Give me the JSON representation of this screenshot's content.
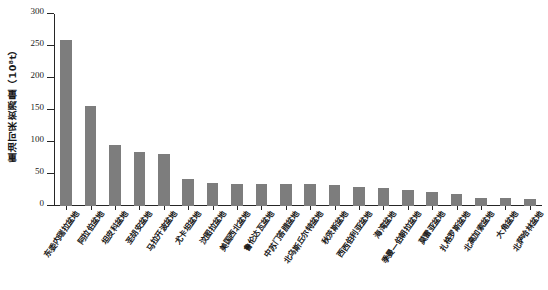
{
  "chart_data": {
    "type": "bar",
    "title": "",
    "xlabel": "",
    "ylabel": "重油可采资源量（10⁸t）",
    "ylim": [
      0,
      300
    ],
    "yticks": [
      0,
      50,
      100,
      150,
      200,
      250,
      300
    ],
    "grid": false,
    "legend": null,
    "bar_color": "#7d7d7d",
    "axis_color": "#262626",
    "categories": [
      "东委内瑞拉盆地",
      "阿拉伯盆地",
      "坦皮科盆地",
      "圣胡安盆地",
      "马拉开波盆地",
      "尤卡坦盆地",
      "汶图拉盆地",
      "美国西北盆地",
      "鲁伦达瓦盆地",
      "中苏门答腊盆地",
      "北乌斯丘尔特盆地",
      "秋茨斯盆地",
      "西西伯利亚盆地",
      "海湾盆地",
      "季曼—伯朝拉盆地",
      "莫雷亚盆地",
      "扎格罗斯盆地",
      "北高加索盆地",
      "大角盆地",
      "北萨哈林盆地"
    ],
    "values": [
      260,
      157,
      95,
      84,
      82,
      42,
      36,
      35,
      35,
      35,
      34,
      33,
      30,
      28,
      25,
      22,
      18,
      13,
      12,
      11
    ]
  }
}
